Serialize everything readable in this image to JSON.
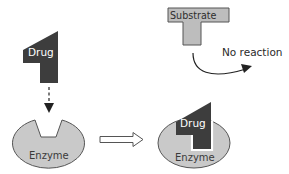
{
  "diagram": {
    "colors": {
      "drug_fill": "#3d3d3d",
      "enzyme_fill": "#c9c9c9",
      "enzyme_stroke": "#555555",
      "substrate_fill": "#bdbdbd",
      "substrate_stroke": "#555555",
      "arrow": "#222222",
      "background": "#ffffff"
    },
    "left": {
      "drug_label": "Drug",
      "enzyme_label": "Enzyme",
      "binding_arrow_style": "dashed"
    },
    "transition_arrow": "hollow-right-arrow",
    "right": {
      "substrate_label": "Substrate",
      "outcome_label": "No reaction",
      "drug_label": "Drug",
      "enzyme_label": "Enzyme"
    }
  }
}
